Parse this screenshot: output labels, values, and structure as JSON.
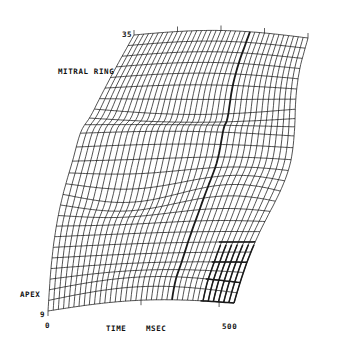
{
  "chart_data": {
    "type": "surface-wireframe",
    "title": "",
    "xlabel": "TIME   MSEC",
    "ylabel_front": "APEX",
    "ylabel_back": "MITRAL RING",
    "x_ticks": [
      "0",
      "500"
    ],
    "x_range": [
      0,
      550
    ],
    "y_ticks": [
      "9",
      "35"
    ],
    "y_range": [
      9,
      35
    ],
    "grid": true,
    "mesh": {
      "time_columns": 36,
      "level_rows": 26,
      "highlighted_time_ms": 360,
      "highlighted_region": "late-time apical region (approx. 400-500 ms, levels 9-14) drawn with heavy lines"
    }
  },
  "labels": {
    "level_top": "35",
    "level_bottom": "9",
    "mitral_ring": "MITRAL RING",
    "apex": "APEX",
    "time_start": "0",
    "time_axis": "TIME",
    "time_unit": "MSEC",
    "time_end": "500"
  },
  "colors": {
    "line": "#1a1a1a",
    "background": "#ffffff"
  }
}
